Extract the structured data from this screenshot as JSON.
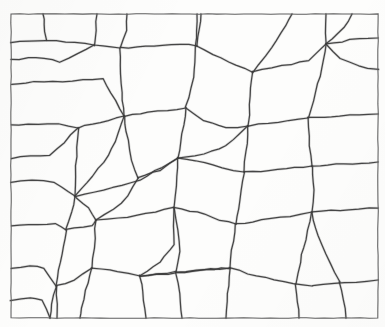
{
  "figure": {
    "kind": "line-drawing",
    "medium": "scanned ink tracing",
    "width": 385,
    "height": 327,
    "background_color": "#fdfdfc",
    "line_color": "#3a3a3a",
    "frame_color": "#5d5d5d",
    "cell_count": 49,
    "caption": ""
  },
  "frame": {
    "name": "border-rectangle",
    "x": 11,
    "y": 14,
    "width": 367,
    "height": 304,
    "stroke_width": 1.05,
    "points": "11,14 378,14 378,318 11,318 11,14"
  },
  "chart_data": {
    "type": "diagram",
    "subtype": "voronoi-cell-network",
    "xlabel": "",
    "ylabel": "",
    "xlim": [
      11,
      378
    ],
    "ylim": [
      14,
      318
    ],
    "grid": false,
    "legend": "none",
    "edges": [
      {
        "id": "e01",
        "points": "11,42 46,40 94,45 120,48"
      },
      {
        "id": "e02",
        "points": "120,48 126,30 127,14"
      },
      {
        "id": "e03",
        "points": "120,48 122,92 124,116"
      },
      {
        "id": "e04",
        "points": "11,85 34,82 72,81 103,78 124,116"
      },
      {
        "id": "e05",
        "points": "11,125 28,124 58,124 78,128"
      },
      {
        "id": "e06",
        "points": "78,128 100,122 124,116"
      },
      {
        "id": "e07",
        "points": "78,128 76,166 75,196"
      },
      {
        "id": "e08",
        "points": "11,182 32,180 54,182 75,196"
      },
      {
        "id": "e09",
        "points": "11,226 38,224 56,224 66,230"
      },
      {
        "id": "e10",
        "points": "66,230 72,212 75,196"
      },
      {
        "id": "e11",
        "points": "66,230 60,262 56,286"
      },
      {
        "id": "e12",
        "points": "11,268 30,266 44,268 56,286"
      },
      {
        "id": "e13",
        "points": "56,286 58,304 57,318"
      },
      {
        "id": "e14",
        "points": "124,116 148,112 186,108"
      },
      {
        "id": "e15",
        "points": "186,108 193,78 196,46 197,14"
      },
      {
        "id": "e16",
        "points": "120,48 154,46 180,44 197,46"
      },
      {
        "id": "e17",
        "points": "197,46 228,62 252,72"
      },
      {
        "id": "e18",
        "points": "252,72 272,48 286,26 292,14"
      },
      {
        "id": "e19",
        "points": "252,72 250,104 248,126"
      },
      {
        "id": "e20",
        "points": "186,108 204,120 226,128 248,126"
      },
      {
        "id": "e21",
        "points": "248,126 278,122 308,118"
      },
      {
        "id": "e22",
        "points": "308,118 316,92 322,68 326,44 326,14"
      },
      {
        "id": "e23",
        "points": "252,72 282,66 308,60 326,44"
      },
      {
        "id": "e24",
        "points": "326,44 350,40 378,38"
      },
      {
        "id": "e25",
        "points": "308,118 340,116 378,114"
      },
      {
        "id": "e26",
        "points": "308,118 310,146 312,166"
      },
      {
        "id": "e27",
        "points": "312,166 344,164 378,162"
      },
      {
        "id": "e28",
        "points": "248,126 246,152 244,172"
      },
      {
        "id": "e29",
        "points": "244,172 278,170 312,166"
      },
      {
        "id": "e30",
        "points": "186,108 182,134 178,158"
      },
      {
        "id": "e31",
        "points": "178,158 204,162 222,168 244,172"
      },
      {
        "id": "e32",
        "points": "75,196 104,190 140,180 178,158"
      },
      {
        "id": "e33",
        "points": "124,116 128,140 132,160 138,178"
      },
      {
        "id": "e34",
        "points": "178,158 176,186 174,208"
      },
      {
        "id": "e35",
        "points": "174,208 146,214 118,218 96,220"
      },
      {
        "id": "e36",
        "points": "96,220 88,208 78,200 75,196"
      },
      {
        "id": "e37",
        "points": "96,220 94,248 92,268"
      },
      {
        "id": "e38",
        "points": "56,286 74,280 92,268"
      },
      {
        "id": "e39",
        "points": "92,268 118,272 140,276"
      },
      {
        "id": "e40",
        "points": "140,276 144,300 146,318"
      },
      {
        "id": "e41",
        "points": "140,276 160,262 174,244 174,208"
      },
      {
        "id": "e42",
        "points": "244,172 240,200 236,224"
      },
      {
        "id": "e43",
        "points": "174,208 198,212 220,220 236,224"
      },
      {
        "id": "e44",
        "points": "236,224 262,220 290,216 312,212"
      },
      {
        "id": "e45",
        "points": "312,166 314,190 312,212"
      },
      {
        "id": "e46",
        "points": "312,212 340,210 378,208"
      },
      {
        "id": "e47",
        "points": "236,224 232,250 230,268"
      },
      {
        "id": "e48",
        "points": "140,276 168,274 200,270 230,268"
      },
      {
        "id": "e49",
        "points": "230,268 228,294 226,318"
      },
      {
        "id": "e50",
        "points": "230,268 256,276 284,282 312,286"
      },
      {
        "id": "e51",
        "points": "312,286 334,284 356,282 378,280"
      },
      {
        "id": "e52",
        "points": "312,212 318,236 330,264 340,282"
      },
      {
        "id": "e53",
        "points": "312,212 306,240 300,262 296,284"
      },
      {
        "id": "e54",
        "points": "296,284 298,302 299,318"
      },
      {
        "id": "e55",
        "points": "340,282 344,300 346,318"
      },
      {
        "id": "e56",
        "points": "56,286 52,304 50,318"
      },
      {
        "id": "e57",
        "points": "11,300 30,298 42,300 50,318"
      },
      {
        "id": "e58",
        "points": "92,268 86,290 82,308 80,318"
      },
      {
        "id": "e59",
        "points": "197,46 200,28 201,14"
      },
      {
        "id": "e60",
        "points": "248,126 226,146 204,154 178,158"
      },
      {
        "id": "e61",
        "points": "326,44 344,28 352,14"
      },
      {
        "id": "e62",
        "points": "378,70 358,66 340,58 326,44"
      },
      {
        "id": "e63",
        "points": "66,230 92,226 96,220"
      },
      {
        "id": "e64",
        "points": "11,158 30,156 50,156 78,128"
      },
      {
        "id": "e65",
        "points": "124,116 116,142 104,162 92,176 75,196"
      },
      {
        "id": "e66",
        "points": "138,178 128,196 114,210 96,220"
      },
      {
        "id": "e67",
        "points": "138,178 160,170 178,158"
      },
      {
        "id": "e68",
        "points": "174,208 178,230 180,252 176,272"
      },
      {
        "id": "e69",
        "points": "176,272 156,274 140,276"
      },
      {
        "id": "e70",
        "points": "176,272 180,294 182,318"
      },
      {
        "id": "e71",
        "points": "230,268 206,270 176,272"
      },
      {
        "id": "e72",
        "points": "46,40 44,24 43,14"
      },
      {
        "id": "e73",
        "points": "11,60 28,58 44,58 60,62 94,45"
      },
      {
        "id": "e74",
        "points": "94,45 96,30 97,14"
      }
    ],
    "cell_count": 49
  }
}
